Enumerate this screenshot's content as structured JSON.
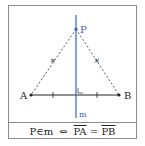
{
  "diagram": {
    "points": {
      "A": "A",
      "B": "B",
      "P": "P"
    },
    "line_label": "m",
    "colors": {
      "line_m": "#3a5fc8",
      "segments": "#222222",
      "border": "#8a8a8a"
    }
  },
  "caption": {
    "left": "P∈m",
    "arrow": "⇔",
    "pa": "PA",
    "eq": "=",
    "pb": "PB"
  }
}
